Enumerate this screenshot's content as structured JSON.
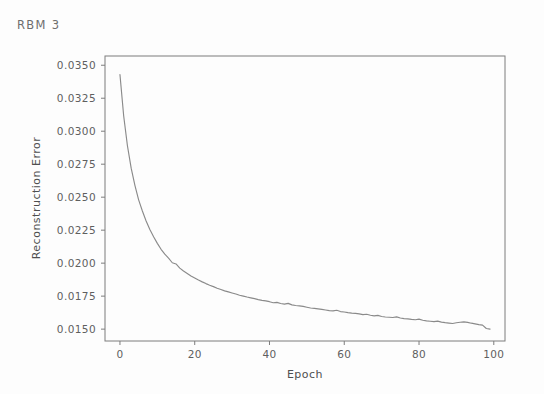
{
  "chart_data": {
    "type": "line",
    "title": "RBM 3",
    "xlabel": "Epoch",
    "ylabel": "Reconstruction Error",
    "xlim": [
      -4,
      103
    ],
    "ylim": [
      0.0141,
      0.0357
    ],
    "xticks": [
      0,
      20,
      40,
      60,
      80,
      100
    ],
    "xticklabels": [
      "0",
      "20",
      "40",
      "60",
      "80",
      "100"
    ],
    "yticks": [
      0.015,
      0.0175,
      0.02,
      0.0225,
      0.025,
      0.0275,
      0.03,
      0.0325,
      0.035
    ],
    "yticklabels": [
      "0.0150",
      "0.0175",
      "0.0200",
      "0.0225",
      "0.0250",
      "0.0275",
      "0.0300",
      "0.0325",
      "0.0350"
    ],
    "grid": false,
    "legend": null,
    "line_color": "#8a8a8a",
    "series": [
      {
        "name": "Reconstruction Error",
        "x": [
          0,
          1,
          2,
          3,
          4,
          5,
          6,
          7,
          8,
          9,
          10,
          11,
          12,
          13,
          14,
          15,
          16,
          17,
          18,
          19,
          20,
          21,
          22,
          23,
          24,
          25,
          26,
          27,
          28,
          29,
          30,
          31,
          32,
          33,
          34,
          35,
          36,
          37,
          38,
          39,
          40,
          41,
          42,
          43,
          44,
          45,
          46,
          47,
          48,
          49,
          50,
          51,
          52,
          53,
          54,
          55,
          56,
          57,
          58,
          59,
          60,
          61,
          62,
          63,
          64,
          65,
          66,
          67,
          68,
          69,
          70,
          71,
          72,
          73,
          74,
          75,
          76,
          77,
          78,
          79,
          80,
          81,
          82,
          83,
          84,
          85,
          86,
          87,
          88,
          89,
          90,
          91,
          92,
          93,
          94,
          95,
          96,
          97,
          98,
          99
        ],
        "values": [
          0.0343,
          0.03115,
          0.0289,
          0.0272,
          0.0259,
          0.0248,
          0.02395,
          0.0232,
          0.02255,
          0.022,
          0.0215,
          0.02105,
          0.02068,
          0.02038,
          0.02003,
          0.01994,
          0.01962,
          0.0194,
          0.01922,
          0.01903,
          0.01888,
          0.01872,
          0.01858,
          0.01845,
          0.01833,
          0.01822,
          0.0181,
          0.018,
          0.0179,
          0.01782,
          0.01774,
          0.01766,
          0.01757,
          0.0175,
          0.01743,
          0.01737,
          0.01731,
          0.01724,
          0.01718,
          0.01714,
          0.01708,
          0.017,
          0.01703,
          0.01694,
          0.0169,
          0.01695,
          0.01684,
          0.01679,
          0.01676,
          0.01672,
          0.01666,
          0.0166,
          0.01657,
          0.01654,
          0.0165,
          0.01645,
          0.0164,
          0.01638,
          0.01643,
          0.01633,
          0.0163,
          0.01625,
          0.01621,
          0.01619,
          0.01616,
          0.0161,
          0.01613,
          0.01605,
          0.016,
          0.01604,
          0.01596,
          0.01592,
          0.0159,
          0.01588,
          0.01593,
          0.01584,
          0.0158,
          0.01578,
          0.01574,
          0.01571,
          0.01576,
          0.01567,
          0.01562,
          0.0156,
          0.01557,
          0.01561,
          0.01553,
          0.01549,
          0.01546,
          0.01543,
          0.01548,
          0.01552,
          0.01555,
          0.01551,
          0.01545,
          0.0154,
          0.01534,
          0.0153,
          0.01505,
          0.015
        ]
      }
    ]
  }
}
